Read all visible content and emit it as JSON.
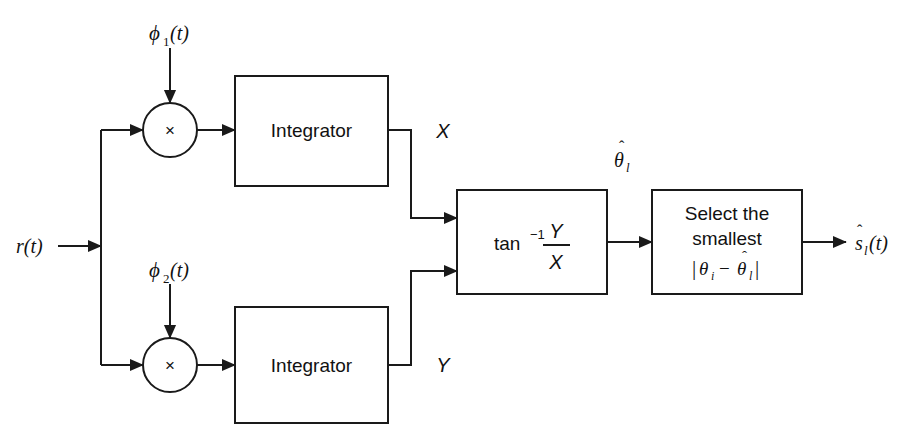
{
  "diagram": {
    "input": {
      "label": "r(t)",
      "name": "received-signal"
    },
    "references": [
      {
        "label_base": "ϕ",
        "sub": "1",
        "suffix": "(t)",
        "name": "phi1"
      },
      {
        "label_base": "ϕ",
        "sub": "2",
        "suffix": "(t)",
        "name": "phi2"
      }
    ],
    "multipliers": [
      {
        "glyph": "×",
        "name": "multiplier-upper"
      },
      {
        "glyph": "×",
        "name": "multiplier-lower"
      }
    ],
    "blocks": [
      {
        "id": "integrator-upper",
        "label": "Integrator"
      },
      {
        "id": "integrator-lower",
        "label": "Integrator"
      },
      {
        "id": "arctan",
        "label_main": "tan",
        "label_exp": "−1",
        "numerator": "Y",
        "denominator": "X"
      },
      {
        "id": "select-smallest",
        "line1": "Select the",
        "line2": "smallest",
        "expr_open": "|",
        "expr_theta1": "θ",
        "expr_sub1": "i",
        "expr_minus": "−",
        "expr_theta2": "θ",
        "expr_hat2": "ˆ",
        "expr_sub2": "l",
        "expr_close": "|"
      }
    ],
    "signals": [
      {
        "id": "x-signal",
        "label": "X"
      },
      {
        "id": "y-signal",
        "label": "Y"
      }
    ],
    "theta_estimate": {
      "base": "θ",
      "hat": "ˆ",
      "sub": "l",
      "name": "theta-hat-l"
    },
    "output": {
      "base": "s",
      "hat": "ˆ",
      "sub": "l",
      "suffix": "(t)",
      "name": "decided-signal"
    },
    "style": {
      "stroke": "#1a1a1a",
      "background": "#ffffff",
      "line_width": 2
    }
  }
}
